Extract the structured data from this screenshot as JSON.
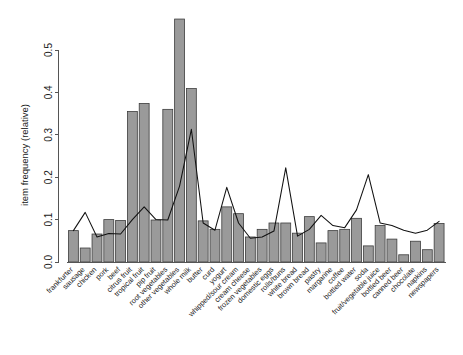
{
  "chart_data": {
    "type": "bar",
    "title": "",
    "subtitle": "",
    "xlabel": "",
    "ylabel": "item frequency (relative)",
    "ylim": [
      0.0,
      0.58
    ],
    "yticks": [
      0.0,
      0.1,
      0.2,
      0.3,
      0.4,
      0.5
    ],
    "ytick_labels": [
      "0.0",
      "0.1",
      "0.2",
      "0.3",
      "0.4",
      "0.5"
    ],
    "grid": false,
    "legend": null,
    "categories": [
      "frankfurter",
      "sausage",
      "chicken",
      "pork",
      "beef",
      "citrus fruit",
      "tropical fruit",
      "pip fruit",
      "root vegetables",
      "other vegetables",
      "whole milk",
      "butter",
      "curd",
      "yogurt",
      "whipped/sour cream",
      "cream cheese",
      "frozen vegetables",
      "domestic eggs",
      "rolls/buns",
      "white bread",
      "brown bread",
      "pastry",
      "margarine",
      "coffee",
      "bottled water",
      "soda",
      "fruit/vegetable juice",
      "bottled beer",
      "canned beer",
      "chocolate",
      "napkins",
      "newspapers"
    ],
    "series": [
      {
        "name": "bars",
        "render": "bar",
        "values": [
          0.074,
          0.033,
          0.066,
          0.1,
          0.098,
          0.355,
          0.374,
          0.099,
          0.36,
          0.573,
          0.409,
          0.097,
          0.077,
          0.13,
          0.114,
          0.059,
          0.077,
          0.092,
          0.092,
          0.068,
          0.107,
          0.045,
          0.074,
          0.077,
          0.103,
          0.038,
          0.086,
          0.054,
          0.017,
          0.049,
          0.029,
          0.091
        ]
      },
      {
        "name": "overlay",
        "render": "line",
        "values": [
          0.074,
          0.117,
          0.059,
          0.067,
          0.066,
          0.1,
          0.13,
          0.1,
          0.099,
          0.179,
          0.313,
          0.092,
          0.075,
          0.176,
          0.092,
          0.056,
          0.059,
          0.073,
          0.222,
          0.061,
          0.077,
          0.11,
          0.086,
          0.081,
          0.123,
          0.206,
          0.092,
          0.086,
          0.075,
          0.068,
          0.075,
          0.096
        ]
      }
    ]
  },
  "colors": {
    "bar_fill": "#9a9a9a",
    "bar_stroke": "#3d3d3d",
    "line_stroke": "#111111",
    "axis": "#555555",
    "text": "#1a1a1a",
    "background": "#ffffff"
  }
}
